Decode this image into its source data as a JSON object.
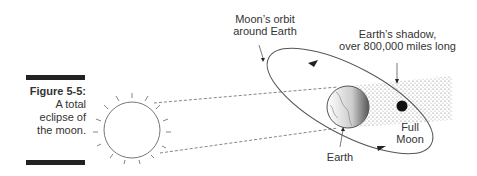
{
  "figure": {
    "number": "Figure 5-5:",
    "caption_lines": [
      "A total",
      "eclipse of",
      "the moon."
    ]
  },
  "labels": {
    "orbit": [
      "Moon’s orbit",
      "around Earth"
    ],
    "shadow": [
      "Earth’s shadow,",
      "over 800,000 miles long"
    ],
    "earth": "Earth",
    "moon": [
      "Full",
      "Moon"
    ]
  },
  "icons": [
    "sun-icon",
    "earth-icon",
    "moon-icon"
  ]
}
